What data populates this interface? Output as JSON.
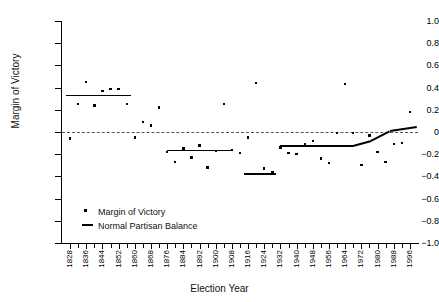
{
  "chart_data": {
    "type": "scatter",
    "title": "",
    "xlabel": "Election Year",
    "ylabel": "Margin of Victory",
    "xlim": [
      1824,
      2000
    ],
    "ylim": [
      -1.0,
      1.0
    ],
    "grid": false,
    "zero_reference_line": 0,
    "legend_position": "inside-bottom-left",
    "y_ticks": [
      "1.0",
      "0.8",
      "0.6",
      "0.4",
      "0.2",
      "0",
      "-0.2",
      "-0.4",
      "-0.6",
      "-0.8",
      "-1.0"
    ],
    "y_tick_values": [
      1.0,
      0.8,
      0.6,
      0.4,
      0.2,
      0,
      -0.2,
      -0.4,
      -0.6,
      -0.8,
      -1.0
    ],
    "x_tick_labels": [
      "1828",
      "1836",
      "1844",
      "1852",
      "1860",
      "1868",
      "1876",
      "1884",
      "1892",
      "1900",
      "1908",
      "1916",
      "1924",
      "1932",
      "1940",
      "1948",
      "1956",
      "1964",
      "1972",
      "1980",
      "1988",
      "1996"
    ],
    "x_tick_values": [
      1828,
      1836,
      1844,
      1852,
      1860,
      1868,
      1876,
      1884,
      1892,
      1900,
      1908,
      1916,
      1924,
      1932,
      1940,
      1948,
      1956,
      1964,
      1972,
      1980,
      1988,
      1996
    ],
    "x_minor_tick_values": [
      1828,
      1832,
      1836,
      1840,
      1844,
      1848,
      1852,
      1856,
      1860,
      1864,
      1868,
      1872,
      1876,
      1880,
      1884,
      1888,
      1892,
      1896,
      1900,
      1904,
      1908,
      1912,
      1916,
      1920,
      1924,
      1928,
      1932,
      1936,
      1940,
      1944,
      1948,
      1952,
      1956,
      1960,
      1964,
      1968,
      1972,
      1976,
      1980,
      1984,
      1988,
      1992,
      1996
    ],
    "series": [
      {
        "name": "Margin of Victory",
        "marker": "dot",
        "color": "#000000",
        "x": [
          1828,
          1832,
          1836,
          1840,
          1844,
          1848,
          1852,
          1856,
          1860,
          1864,
          1868,
          1872,
          1876,
          1880,
          1884,
          1888,
          1892,
          1896,
          1900,
          1904,
          1908,
          1912,
          1916,
          1920,
          1924,
          1928,
          1932,
          1936,
          1940,
          1944,
          1948,
          1952,
          1956,
          1960,
          1964,
          1968,
          1972,
          1976,
          1980,
          1984,
          1988,
          1992,
          1996
        ],
        "y": [
          -0.06,
          0.25,
          0.45,
          0.24,
          0.37,
          0.39,
          0.39,
          0.25,
          -0.05,
          0.09,
          0.06,
          0.22,
          -0.18,
          -0.27,
          -0.15,
          -0.23,
          -0.12,
          -0.32,
          -0.17,
          0.25,
          -0.16,
          -0.19,
          -0.05,
          0.44,
          -0.33,
          -0.36,
          -0.14,
          -0.19,
          -0.2,
          -0.11,
          -0.08,
          -0.24,
          -0.28,
          -0.01,
          0.43,
          -0.01,
          -0.3,
          -0.03,
          -0.18,
          -0.27,
          -0.11,
          -0.1,
          0.18
        ]
      }
    ],
    "normal_partisan_balance": {
      "name": "Normal Partisan Balance",
      "color": "#000000",
      "segments": [
        {
          "x_start": 1826,
          "x_end": 1858,
          "y_start": 0.33,
          "y_end": 0.33
        },
        {
          "x_start": 1876,
          "x_end": 1908,
          "y_start": -0.165,
          "y_end": -0.165
        },
        {
          "x_start": 1914,
          "x_end": 1930,
          "y_start": -0.38,
          "y_end": -0.38
        },
        {
          "x_start": 1932,
          "x_end": 1968,
          "y_start": -0.125,
          "y_end": -0.125
        },
        {
          "x_start": 1968,
          "x_end": 1976,
          "y_start": -0.125,
          "y_end": -0.085
        },
        {
          "x_start": 1976,
          "x_end": 1986,
          "y_start": -0.085,
          "y_end": 0.01
        },
        {
          "x_start": 1986,
          "x_end": 1999,
          "y_start": 0.01,
          "y_end": 0.045
        }
      ]
    },
    "legend": [
      {
        "label": "Margin of Victory",
        "marker": "dot"
      },
      {
        "label": "Normal Partisan Balance",
        "marker": "line"
      }
    ]
  }
}
